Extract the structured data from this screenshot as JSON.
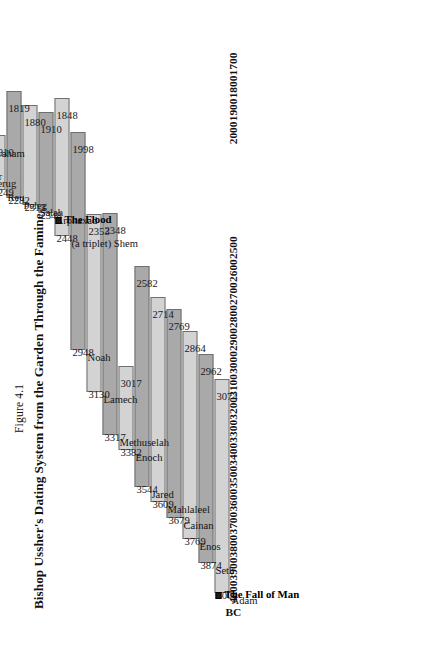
{
  "figure": {
    "number": "Figure 4.1",
    "title": "Bishop Ussher's Dating System from the Garden Through the Famine"
  },
  "axis": {
    "unit_label": "BC",
    "ticks": [
      "1700",
      "1800",
      "1900",
      "2000",
      "2100",
      "2200",
      "2300",
      "2400",
      "2500",
      "2600",
      "2700",
      "2800",
      "2900",
      "3000",
      "3100",
      "3200",
      "3300",
      "3400",
      "3500",
      "3600",
      "3700",
      "3800",
      "3900",
      "4000"
    ],
    "visible_ticks": [
      "1700",
      "1800",
      "1900",
      "2000",
      "2500",
      "2600",
      "2700",
      "2800",
      "2900",
      "3000",
      "3100",
      "3200",
      "3300",
      "3400",
      "3500",
      "3600",
      "3700",
      "3800",
      "3900",
      "4000"
    ],
    "min": 1687,
    "max": 4004,
    "direction": "descending"
  },
  "colors": {
    "bar_light": "#d3d3d3",
    "bar_dark": "#a9a9a9",
    "bar_border": "#6f6f6f",
    "text": "#111111",
    "background": "#ffffff"
  },
  "events": [
    {
      "id": "fall-of-man",
      "label": "The Fall of Man",
      "marker": "square-bullet",
      "year": 3983
    },
    {
      "id": "the-flood",
      "label": "The Flood",
      "marker": "square-bullet",
      "year": 2348
    },
    {
      "id": "seven-year-famine",
      "label": "The Seven-Year Famine",
      "marker": "square-bullet",
      "year": 1706
    }
  ],
  "chart_data": {
    "type": "bar",
    "orientation": "horizontal-rotated-gantt",
    "title": "Bishop Ussher's Dating System from the Garden Through the Famine",
    "xlabel": "BC",
    "ylabel": "",
    "xlim": [
      4000,
      1700
    ],
    "grid": false,
    "legend": "none",
    "categories": [
      "Adam",
      "Seth",
      "Enos",
      "Cainan",
      "Mahlaleel",
      "Jared",
      "Enoch",
      "Methuselah",
      "Lamech",
      "Noah",
      "Shem",
      "Arphaxad",
      "Salah",
      "Peleg",
      "Reu",
      "Serug",
      "Nahor",
      "Terah",
      "Abraham",
      "Isaac",
      "Jacob",
      "Joseph"
    ],
    "bars": [
      {
        "name": "Adam",
        "prefix": "",
        "start": 4004,
        "end": 3074,
        "shade": "light"
      },
      {
        "name": "Seth",
        "prefix": "",
        "start": 3874,
        "end": 2962,
        "shade": "dark"
      },
      {
        "name": "Enos",
        "prefix": "",
        "start": 3769,
        "end": 2864,
        "shade": "light"
      },
      {
        "name": "Cainan",
        "prefix": "",
        "start": 3679,
        "end": 2769,
        "shade": "dark"
      },
      {
        "name": "Mahlaleel",
        "prefix": "",
        "start": 3609,
        "end": 2714,
        "shade": "light"
      },
      {
        "name": "Jared",
        "prefix": "",
        "start": 3544,
        "end": 2582,
        "shade": "dark"
      },
      {
        "name": "Enoch",
        "prefix": "",
        "start": 3382,
        "end": 3017,
        "shade": "light"
      },
      {
        "name": "Methuselah",
        "prefix": "",
        "start": 3317,
        "end": 2348,
        "shade": "dark"
      },
      {
        "name": "Lamech",
        "prefix": "",
        "start": 3130,
        "end": 2353,
        "shade": "light"
      },
      {
        "name": "Noah",
        "prefix": "",
        "start": 2948,
        "end": 1998,
        "shade": "dark"
      },
      {
        "name": "Shem",
        "prefix": "(a triplet)",
        "start": 2448,
        "end": 1848,
        "shade": "light"
      },
      {
        "name": "Arphaxad",
        "prefix": "",
        "start": 2348,
        "end": 1910,
        "shade": "dark"
      },
      {
        "name": "Salah",
        "prefix": "",
        "start": 2313,
        "end": 1880,
        "shade": "light"
      },
      {
        "name": "Peleg",
        "prefix": "",
        "start": 2282,
        "end": 1819,
        "shade": "dark"
      },
      {
        "name": "Reu",
        "prefix": "",
        "start": 2249,
        "end": 2010,
        "shade": "light"
      },
      {
        "name": "Serug",
        "prefix": "",
        "start": 2187,
        "end": 1957,
        "shade": "dark"
      },
      {
        "name": "Nahor",
        "prefix": "",
        "start": 2157,
        "end": 2009,
        "shade": "light"
      },
      {
        "name": "Terah",
        "prefix": "",
        "start": 2124,
        "end": 1919,
        "shade": "dark"
      },
      {
        "name": "Abraham",
        "prefix": "(a triplet)",
        "start": 2058,
        "end": 1883,
        "shade": "light"
      },
      {
        "name": "Isaac",
        "prefix": "",
        "start": 1958,
        "end": 1778,
        "shade": "dark"
      },
      {
        "name": "Jacob",
        "prefix": "(a twin)",
        "start": 1888,
        "end": 1741,
        "shade": "light"
      },
      {
        "name": "Joseph",
        "prefix": "",
        "start": 1800,
        "end": 1687,
        "shade": "dark"
      }
    ]
  }
}
